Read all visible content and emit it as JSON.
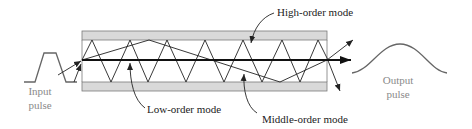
{
  "diagram": {
    "type": "multimode-fiber-modal-dispersion",
    "labels": {
      "input_line1": "Input",
      "input_line2": "pulse",
      "output_line1": "Output",
      "output_line2": "pulse",
      "high_order": "High-order mode",
      "low_order": "Low-order mode",
      "middle_order": "Middle-order mode"
    },
    "colors": {
      "cladding_fill": "#d9d9d9",
      "cladding_stroke": "#7a7a7a",
      "ray": "#222222",
      "pulse": "#666666",
      "pulse_label": "#8a8a8a"
    },
    "fiber": {
      "x_start": 82,
      "x_end": 327,
      "top_band": [
        31,
        40
      ],
      "bottom_band": [
        82,
        91
      ],
      "axis_y": 60
    },
    "modes": [
      {
        "name": "High-order mode",
        "description": "steep zigzag reflecting many times between core boundaries"
      },
      {
        "name": "Middle-order mode",
        "description": "shallow zigzag with few reflections"
      },
      {
        "name": "Low-order mode",
        "description": "straight ray along fiber axis"
      }
    ]
  }
}
